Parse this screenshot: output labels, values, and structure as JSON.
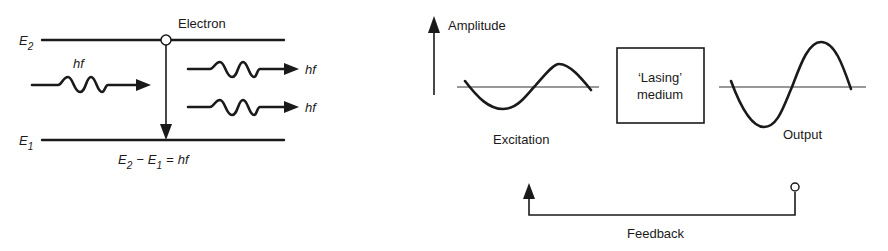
{
  "energy_diagram": {
    "upper_level": {
      "symbol": "E",
      "subscript": "2"
    },
    "lower_level": {
      "symbol": "E",
      "subscript": "1"
    },
    "electron_label": "Electron",
    "incoming_photon_label": "hf",
    "emitted_photon_labels": [
      "hf",
      "hf"
    ],
    "equation": {
      "left_a": "E",
      "left_a_sub": "2",
      "minus": "−",
      "left_b": "E",
      "left_b_sub": "1",
      "equals": "=",
      "right": "hf"
    }
  },
  "oscillator_diagram": {
    "axis_label": "Amplitude",
    "medium_box": {
      "line1": "‘Lasing’",
      "line2": "medium"
    },
    "excitation_label": "Excitation",
    "output_label": "Output",
    "feedback_label": "Feedback"
  },
  "colors": {
    "ink": "#1a1a1a",
    "background": "#ffffff"
  }
}
